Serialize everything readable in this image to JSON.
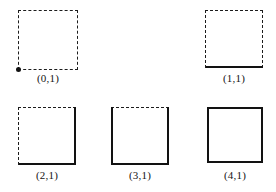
{
  "canvas": {
    "width": 276,
    "height": 192,
    "background": "#ffffff",
    "ink": "#121212"
  },
  "figures": [
    {
      "label": "(0,1)",
      "x": 18,
      "y": 10,
      "size": 60,
      "label_y": 72,
      "edges": {
        "top": "dashed",
        "right": "dashed",
        "bottom": "dashed",
        "left": "dashed"
      },
      "marker": {
        "name": "origin-dot",
        "corner": "bottom-left",
        "shape": "filled-circle"
      }
    },
    {
      "label": "(1,1)",
      "x": 205,
      "y": 10,
      "size": 58,
      "label_y": 72,
      "edges": {
        "top": "dashed",
        "right": "dashed",
        "bottom": "solid",
        "left": "dashed"
      },
      "marker": null
    },
    {
      "label": "(2,1)",
      "x": 18,
      "y": 107,
      "size": 58,
      "label_y": 169,
      "edges": {
        "top": "dashed",
        "right": "solid",
        "bottom": "solid",
        "left": "dashed"
      },
      "marker": null
    },
    {
      "label": "(3,1)",
      "x": 111,
      "y": 107,
      "size": 58,
      "label_y": 169,
      "edges": {
        "top": "dashed",
        "right": "solid",
        "bottom": "solid",
        "left": "solid"
      },
      "marker": null
    },
    {
      "label": "(4,1)",
      "x": 207,
      "y": 107,
      "size": 56,
      "label_y": 169,
      "edges": {
        "top": "solid",
        "right": "solid",
        "bottom": "solid",
        "left": "solid"
      },
      "marker": null
    }
  ]
}
